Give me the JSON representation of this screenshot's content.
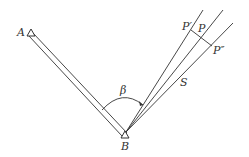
{
  "diagram": {
    "labels": {
      "A": "A",
      "B": "B",
      "beta": "β",
      "S": "S",
      "P": "P",
      "P_prime": "P′",
      "P_double_prime": "P″"
    },
    "points": {
      "A": [
        31,
        33
      ],
      "B": [
        125,
        135
      ]
    },
    "colors": {
      "stroke": "#333333",
      "background": "#ffffff"
    }
  }
}
